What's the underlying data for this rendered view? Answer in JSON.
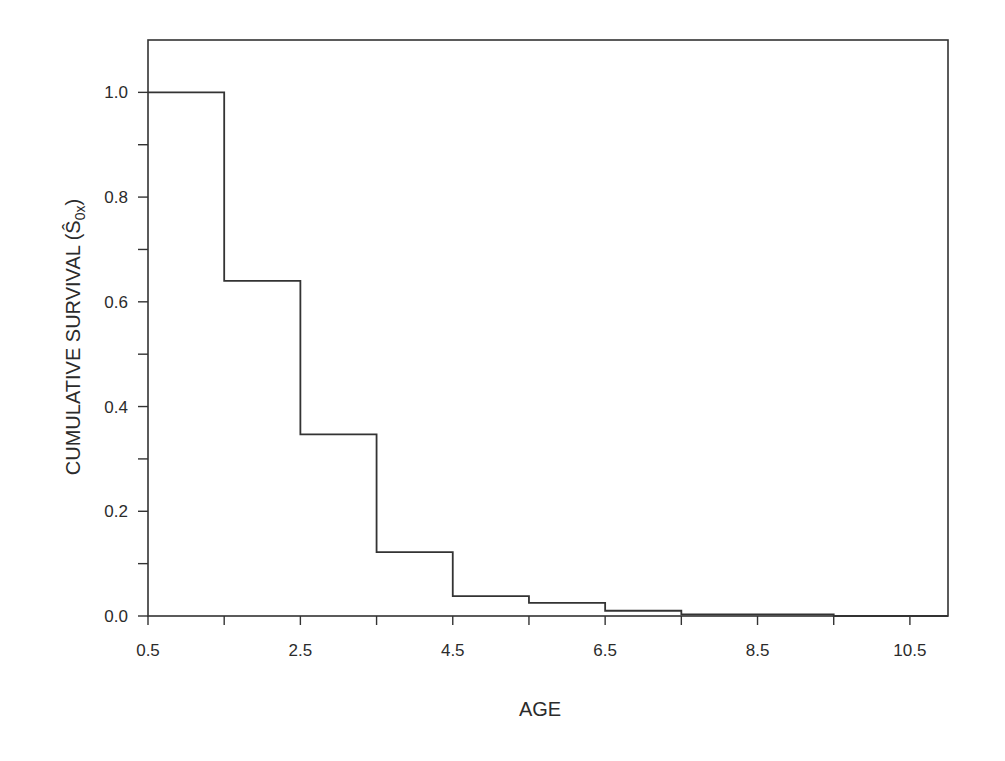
{
  "chart_data": {
    "type": "line",
    "subtype": "step",
    "title": "",
    "xlabel": "AGE",
    "ylabel": "CUMULATIVE SURVIVAL",
    "ylabel_symbol": "Ŝ",
    "ylabel_subscript": "0x",
    "xlim": [
      0.5,
      11.0
    ],
    "ylim": [
      0.0,
      1.1
    ],
    "x_ticks": [
      0.5,
      1.5,
      2.5,
      3.5,
      4.5,
      5.5,
      6.5,
      7.5,
      8.5,
      9.5,
      10.5
    ],
    "x_tick_labels": [
      "0.5",
      "",
      "2.5",
      "",
      "4.5",
      "",
      "6.5",
      "",
      "8.5",
      "",
      "10.5"
    ],
    "y_ticks": [
      0.0,
      0.1,
      0.2,
      0.3,
      0.4,
      0.5,
      0.6,
      0.7,
      0.8,
      0.9,
      1.0
    ],
    "y_tick_labels": [
      "0.0",
      "",
      "0.2",
      "",
      "0.4",
      "",
      "0.6",
      "",
      "0.8",
      "",
      "1.0"
    ],
    "grid": false,
    "legend": null,
    "series": [
      {
        "name": "Cumulative survival",
        "x": [
          0.5,
          1.5,
          2.5,
          3.5,
          4.5,
          5.5,
          6.5,
          7.5,
          9.5,
          10.5
        ],
        "values": [
          1.0,
          0.64,
          0.347,
          0.122,
          0.038,
          0.025,
          0.01,
          0.003,
          0.0,
          0.0
        ]
      }
    ],
    "line_color": "#333333"
  },
  "labels": {
    "x_axis_title": "AGE",
    "y_axis_title": "CUMULATIVE SURVIVAL (",
    "y_axis_symbol": "Ŝ",
    "y_axis_subscript": "0x",
    "y_axis_close": ")"
  }
}
